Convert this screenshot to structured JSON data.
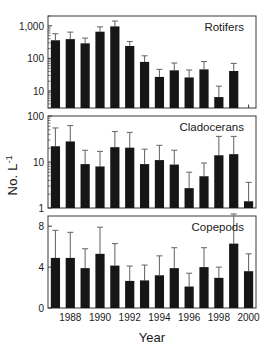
{
  "figure": {
    "axis_label_y": "No. L",
    "axis_label_y_exponent": "-1",
    "axis_label_x": "Year"
  },
  "chart_data": [
    {
      "type": "bar",
      "title": "Rotifers",
      "panel": "top",
      "xlabel": "Year",
      "ylabel": "No. L-1",
      "yscale": "log",
      "ylim": [
        3,
        2000
      ],
      "yticks": [
        10,
        100,
        1000
      ],
      "ytick_labels": [
        "10",
        "100",
        "1,000"
      ],
      "grid": false,
      "x": [
        1987,
        1988,
        1989,
        1990,
        1991,
        1992,
        1993,
        1994,
        1995,
        1996,
        1997,
        1998,
        1999
      ],
      "categories": [
        "1987",
        "1988",
        "1989",
        "1990",
        "1991",
        "1992",
        "1993",
        "1994",
        "1995",
        "1996",
        "1997",
        "1998",
        "1999"
      ],
      "values": [
        360,
        390,
        290,
        660,
        960,
        240,
        78,
        27,
        43,
        26,
        46,
        6.5,
        41
      ],
      "err_upper": [
        570,
        640,
        420,
        930,
        1400,
        330,
        120,
        46,
        72,
        44,
        80,
        14,
        70
      ],
      "err_lower": [
        360,
        390,
        290,
        660,
        960,
        240,
        78,
        27,
        43,
        26,
        46,
        6.5,
        41
      ]
    },
    {
      "type": "bar",
      "title": "Cladocerans",
      "panel": "middle",
      "xlabel": "Year",
      "ylabel": "No. L-1",
      "yscale": "log",
      "ylim": [
        1,
        100
      ],
      "yticks": [
        1,
        10,
        100
      ],
      "ytick_labels": [
        "1",
        "10",
        "100"
      ],
      "grid": false,
      "x": [
        1987,
        1988,
        1989,
        1990,
        1991,
        1992,
        1993,
        1994,
        1995,
        1996,
        1997,
        1998,
        1999,
        2000
      ],
      "categories": [
        "1987",
        "1988",
        "1989",
        "1990",
        "1991",
        "1992",
        "1993",
        "1994",
        "1995",
        "1996",
        "1997",
        "1998",
        "1999",
        "2000"
      ],
      "values": [
        22,
        28,
        9.0,
        8.0,
        21,
        20.5,
        9.0,
        11,
        8.8,
        2.7,
        4.9,
        14,
        14.8,
        1.4
      ],
      "err_upper": [
        55,
        62,
        18,
        17,
        46,
        44,
        19,
        23,
        18,
        6.0,
        9.5,
        36,
        36,
        3.6
      ],
      "err_lower": [
        22,
        28,
        9.0,
        8.0,
        21,
        20.5,
        9.0,
        11,
        8.8,
        2.7,
        4.9,
        14,
        14.8,
        1.4
      ]
    },
    {
      "type": "bar",
      "title": "Copepods",
      "panel": "bottom",
      "xlabel": "Year",
      "ylabel": "No. L-1",
      "yscale": "linear",
      "ylim": [
        0,
        9
      ],
      "yticks": [
        0,
        4,
        8
      ],
      "ytick_labels": [
        "0",
        "4",
        "8"
      ],
      "grid": false,
      "x": [
        1987,
        1988,
        1989,
        1990,
        1991,
        1992,
        1993,
        1994,
        1995,
        1996,
        1997,
        1998,
        1999,
        2000
      ],
      "categories": [
        "1987",
        "1988",
        "1989",
        "1990",
        "1991",
        "1992",
        "1993",
        "1994",
        "1995",
        "1996",
        "1997",
        "1998",
        "1999",
        "2000"
      ],
      "values": [
        4.9,
        4.9,
        3.9,
        5.3,
        4.15,
        2.65,
        2.7,
        3.2,
        3.9,
        2.1,
        4.0,
        2.95,
        6.3,
        3.6
      ],
      "err_upper": [
        7.6,
        7.4,
        5.8,
        7.9,
        6.3,
        4.1,
        4.2,
        5.1,
        5.9,
        3.4,
        5.9,
        4.0,
        9.2,
        5.3
      ],
      "err_lower": [
        4.9,
        4.9,
        3.9,
        5.3,
        4.15,
        2.65,
        2.7,
        3.2,
        3.9,
        2.1,
        4.0,
        2.95,
        6.3,
        3.6
      ]
    }
  ],
  "xaxis": {
    "ticks": [
      1988,
      1990,
      1992,
      1994,
      1996,
      1998,
      2000
    ],
    "tick_labels": [
      "1988",
      "1990",
      "1992",
      "1994",
      "1996",
      "1998",
      "2000"
    ],
    "domain": [
      1986.5,
      2000.5
    ]
  },
  "style": {
    "bar_color": "#161616",
    "axis_color": "#3a3a3a",
    "error_color": "#6e6e6e",
    "background": "#ffffff"
  }
}
